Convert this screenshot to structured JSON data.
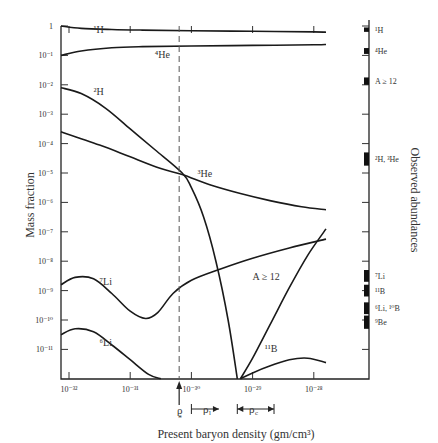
{
  "chart_data": {
    "type": "line",
    "title": "",
    "xlabel": "Present baryon density (gm/cm³)",
    "ylabel": "Mass fraction",
    "ylabel_right": "Observed abundances",
    "xscale": "log",
    "yscale": "log",
    "xlim": [
      1.3e-32,
      8e-29
    ],
    "ylim": [
      1e-12,
      1
    ],
    "x_ticks": [
      {
        "value": -32,
        "label": "10⁻³²"
      },
      {
        "value": -31,
        "label": "10⁻³¹"
      },
      {
        "value": -30,
        "label": "10⁻³⁰"
      },
      {
        "value": -29,
        "label": "10⁻²⁹"
      },
      {
        "value": -28,
        "label": "10⁻²⁸"
      }
    ],
    "y_ticks": [
      {
        "value": 0,
        "label": "1"
      },
      {
        "value": -1,
        "label": "10⁻¹"
      },
      {
        "value": -2,
        "label": "10⁻²"
      },
      {
        "value": -3,
        "label": "10⁻³"
      },
      {
        "value": -4,
        "label": "10⁻⁴"
      },
      {
        "value": -5,
        "label": "10⁻⁵"
      },
      {
        "value": -6,
        "label": "10⁻⁶"
      },
      {
        "value": -7,
        "label": "10⁻⁷"
      },
      {
        "value": -8,
        "label": "10⁻⁸"
      },
      {
        "value": -9,
        "label": "10⁻⁹"
      },
      {
        "value": -10,
        "label": "10⁻¹⁰"
      },
      {
        "value": -11,
        "label": "10⁻¹¹"
      }
    ],
    "grid": false,
    "series": [
      {
        "name": "¹H",
        "log_x": [
          -32.13,
          -31.8,
          -31.3,
          -30.8,
          -30.0,
          -29.0,
          -28.0,
          -27.8
        ],
        "log_y": [
          0,
          -0.08,
          -0.12,
          -0.14,
          -0.16,
          -0.18,
          -0.2,
          -0.21
        ]
      },
      {
        "name": "⁴He",
        "log_x": [
          -32.13,
          -31.8,
          -31.3,
          -30.8,
          -30.0,
          -29.0,
          -28.0,
          -27.8
        ],
        "log_y": [
          -1.0,
          -0.85,
          -0.74,
          -0.7,
          -0.68,
          -0.66,
          -0.64,
          -0.63
        ]
      },
      {
        "name": "²H",
        "log_x": [
          -32.13,
          -31.8,
          -31.4,
          -31.0,
          -30.6,
          -30.15,
          -30.0,
          -29.8,
          -29.6,
          -29.4,
          -29.25
        ],
        "log_y": [
          -2.1,
          -2.3,
          -2.8,
          -3.5,
          -4.2,
          -5.0,
          -5.5,
          -6.5,
          -8.0,
          -10.0,
          -12.0
        ]
      },
      {
        "name": "³He",
        "log_x": [
          -32.13,
          -31.5,
          -31.0,
          -30.5,
          -30.15,
          -29.7,
          -29.2,
          -28.7,
          -28.2,
          -27.8
        ],
        "log_y": [
          -3.6,
          -4.05,
          -4.45,
          -4.85,
          -5.05,
          -5.4,
          -5.7,
          -5.95,
          -6.15,
          -6.25
        ]
      },
      {
        "name": "⁷Li",
        "log_x": [
          -32.13,
          -31.9,
          -31.6,
          -31.3,
          -31.0,
          -30.75,
          -30.55,
          -30.3,
          -30.0,
          -29.5,
          -29.0,
          -28.4,
          -27.8
        ],
        "log_y": [
          -8.8,
          -8.55,
          -8.6,
          -9.1,
          -9.7,
          -9.95,
          -9.75,
          -9.1,
          -8.65,
          -8.25,
          -7.9,
          -7.55,
          -7.25
        ]
      },
      {
        "name": "⁶Li",
        "log_x": [
          -32.13,
          -31.9,
          -31.6,
          -31.3,
          -31.0,
          -30.7,
          -30.5
        ],
        "log_y": [
          -10.5,
          -10.3,
          -10.4,
          -10.85,
          -11.35,
          -11.85,
          -12.0
        ]
      },
      {
        "name": "A ≥ 12",
        "log_x": [
          -29.2,
          -29.0,
          -28.7,
          -28.4,
          -28.1,
          -27.8
        ],
        "log_y": [
          -12.0,
          -11.3,
          -10.1,
          -8.9,
          -7.8,
          -6.9
        ]
      },
      {
        "name": "¹¹B",
        "log_x": [
          -29.2,
          -29.0,
          -28.7,
          -28.4,
          -28.1,
          -27.8
        ],
        "log_y": [
          -12.0,
          -11.8,
          -11.55,
          -11.35,
          -11.3,
          -11.45
        ]
      }
    ],
    "annotations": [
      {
        "text": "¹H",
        "log_x": -31.6,
        "log_y": -0.25
      },
      {
        "text": "⁴He",
        "log_x": -30.6,
        "log_y": -1.1
      },
      {
        "text": "²H",
        "log_x": -31.6,
        "log_y": -2.35
      },
      {
        "text": "³He",
        "log_x": -29.9,
        "log_y": -5.15
      },
      {
        "text": "⁷Li",
        "log_x": -31.5,
        "log_y": -8.8
      },
      {
        "text": "⁶Li",
        "log_x": -31.5,
        "log_y": -10.9
      },
      {
        "text": "A ≥ 12",
        "log_x": -29.0,
        "log_y": -8.65
      },
      {
        "text": "¹¹B",
        "log_x": -28.8,
        "log_y": -11.1
      }
    ],
    "reference_line": {
      "label": "ρ⁎",
      "log_x": -30.2,
      "style": "dashed"
    },
    "density_ranges": [
      {
        "label": "ρₗ",
        "from": -30.0,
        "to": -29.55,
        "direction": "right"
      },
      {
        "label": "ρ꜀",
        "from": -29.25,
        "to": -28.65,
        "direction": "both"
      }
    ],
    "observed_abundances": [
      {
        "label": "¹H",
        "log_y_top": -0.05,
        "log_y_bottom": -0.2
      },
      {
        "label": "⁴He",
        "log_y_top": -0.75,
        "log_y_bottom": -0.95
      },
      {
        "label": "A ≥ 12",
        "log_y_top": -1.75,
        "log_y_bottom": -2.0
      },
      {
        "label": "²H, ³He",
        "log_y_top": -4.3,
        "log_y_bottom": -4.75
      },
      {
        "label": "⁷Li",
        "log_y_top": -8.3,
        "log_y_bottom": -8.7
      },
      {
        "label": "¹¹B",
        "log_y_top": -8.8,
        "log_y_bottom": -9.2
      },
      {
        "label": "⁶Li, ¹⁰B",
        "log_y_top": -9.4,
        "log_y_bottom": -9.8
      },
      {
        "label": "⁹Be",
        "log_y_top": -9.85,
        "log_y_bottom": -10.3
      }
    ]
  },
  "labels": {
    "ylabel": "Mass fraction",
    "ylabel_right": "Observed abundances",
    "xlabel": "Present baryon density (gm/cm³)",
    "rho_star": "ρ",
    "rho_star_sub": "*",
    "rho_l": "ρ",
    "rho_l_sub": "l",
    "rho_c": "ρ",
    "rho_c_sub": "c"
  }
}
